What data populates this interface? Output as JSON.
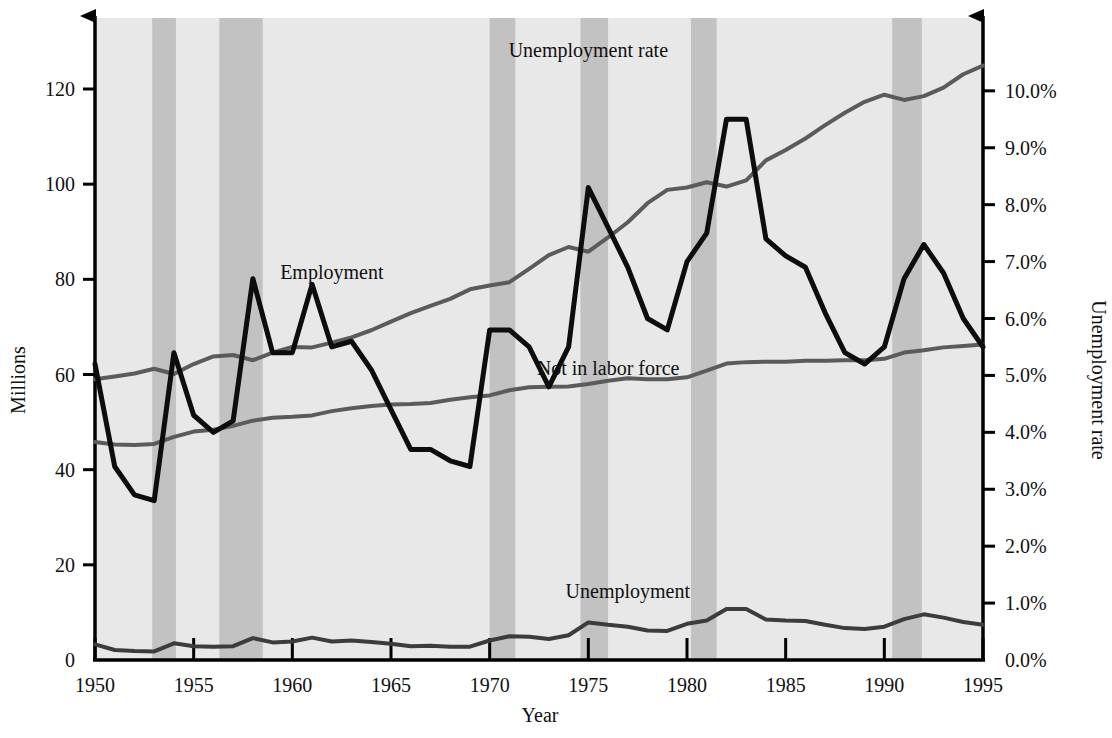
{
  "chart_data": {
    "type": "line",
    "title": "",
    "xlabel": "Year",
    "ylabel_left": "Millions",
    "ylabel_right": "Unemployment rate",
    "xlim": [
      1950,
      1995
    ],
    "ylim_left": [
      0,
      135
    ],
    "ylim_right": [
      0.0,
      11.35
    ],
    "grid": false,
    "legend_position": "inline-annotations",
    "plot_background": "#e8e8e8",
    "recession_band_color": "#c2c2c2",
    "xticks": [
      1950,
      1955,
      1960,
      1965,
      1970,
      1975,
      1980,
      1985,
      1990,
      1995
    ],
    "xtick_labels": [
      "1950",
      "1955",
      "1960",
      "1965",
      "1970",
      "1975",
      "1980",
      "1985",
      "1990",
      "1995"
    ],
    "yticks_left": [
      0,
      20,
      40,
      60,
      80,
      100,
      120
    ],
    "ytick_labels_left": [
      "0",
      "20",
      "40",
      "60",
      "80",
      "100",
      "120"
    ],
    "yticks_right": [
      0.0,
      1.0,
      2.0,
      3.0,
      4.0,
      5.0,
      6.0,
      7.0,
      8.0,
      9.0,
      10.0
    ],
    "ytick_labels_right": [
      "0.0%",
      "1.0%",
      "2.0%",
      "3.0%",
      "4.0%",
      "5.0%",
      "6.0%",
      "7.0%",
      "8.0%",
      "9.0%",
      "10.0%"
    ],
    "x": [
      1950,
      1951,
      1952,
      1953,
      1954,
      1955,
      1956,
      1957,
      1958,
      1959,
      1960,
      1961,
      1962,
      1963,
      1964,
      1965,
      1966,
      1967,
      1968,
      1969,
      1970,
      1971,
      1972,
      1973,
      1974,
      1975,
      1976,
      1977,
      1978,
      1979,
      1980,
      1981,
      1982,
      1983,
      1984,
      1985,
      1986,
      1987,
      1988,
      1989,
      1990,
      1991,
      1992,
      1993,
      1994,
      1995
    ],
    "series": [
      {
        "name": "Employment",
        "axis": "left",
        "unit": "millions",
        "color": "#5b5b5b",
        "line_width": 4,
        "label_x": 1962,
        "label_y": 80,
        "values": [
          59.0,
          59.6,
          60.2,
          61.2,
          60.1,
          62.2,
          63.8,
          64.1,
          63.0,
          64.6,
          65.8,
          65.7,
          66.7,
          67.8,
          69.3,
          71.1,
          72.9,
          74.4,
          75.9,
          77.9,
          78.7,
          79.4,
          82.2,
          85.1,
          86.8,
          85.8,
          88.8,
          92.0,
          96.0,
          98.8,
          99.3,
          100.4,
          99.5,
          100.8,
          105.0,
          107.2,
          109.6,
          112.4,
          115.0,
          117.3,
          118.8,
          117.7,
          118.5,
          120.3,
          123.1,
          124.9
        ]
      },
      {
        "name": "Not in labor force",
        "axis": "left",
        "unit": "millions",
        "color": "#5b5b5b",
        "line_width": 4,
        "label_x": 1976,
        "label_y": 60,
        "values": [
          45.8,
          45.3,
          45.2,
          45.4,
          46.9,
          48.0,
          48.4,
          49.2,
          50.3,
          50.9,
          51.1,
          51.4,
          52.3,
          52.9,
          53.4,
          53.7,
          53.8,
          54.0,
          54.7,
          55.2,
          55.6,
          56.7,
          57.3,
          57.4,
          57.5,
          58.0,
          58.7,
          59.2,
          59.0,
          59.0,
          59.4,
          60.8,
          62.3,
          62.6,
          62.7,
          62.7,
          62.9,
          62.9,
          63.0,
          63.0,
          63.3,
          64.6,
          65.1,
          65.7,
          66.0,
          66.3
        ]
      },
      {
        "name": "Unemployment",
        "axis": "left",
        "unit": "millions",
        "color": "#3c3c3c",
        "line_width": 4,
        "label_x": 1977,
        "label_y": 13,
        "values": [
          3.3,
          2.1,
          1.9,
          1.8,
          3.5,
          2.9,
          2.8,
          2.9,
          4.6,
          3.7,
          3.9,
          4.7,
          3.9,
          4.1,
          3.8,
          3.4,
          2.9,
          3.0,
          2.8,
          2.8,
          4.1,
          5.0,
          4.9,
          4.4,
          5.2,
          7.9,
          7.4,
          7.0,
          6.2,
          6.1,
          7.6,
          8.3,
          10.7,
          10.7,
          8.5,
          8.3,
          8.2,
          7.4,
          6.7,
          6.5,
          7.0,
          8.6,
          9.6,
          8.9,
          8.0,
          7.4
        ]
      },
      {
        "name": "Unemployment rate",
        "axis": "right",
        "unit": "percent",
        "color": "#0d0d0d",
        "line_width": 5,
        "label_x": 1975,
        "label_y": 10.6,
        "values": [
          5.2,
          3.4,
          2.9,
          2.8,
          5.4,
          4.3,
          4.0,
          4.2,
          6.7,
          5.4,
          5.4,
          6.6,
          5.5,
          5.6,
          5.1,
          4.4,
          3.7,
          3.7,
          3.5,
          3.4,
          5.8,
          5.8,
          5.5,
          4.8,
          5.5,
          8.3,
          7.6,
          6.9,
          6.0,
          5.8,
          7.0,
          7.5,
          9.5,
          9.5,
          7.4,
          7.1,
          6.9,
          6.1,
          5.4,
          5.2,
          5.5,
          6.7,
          7.3,
          6.8,
          6.0,
          5.5
        ]
      }
    ],
    "recession_bands": [
      {
        "start": 1952.9,
        "end": 1954.1
      },
      {
        "start": 1956.3,
        "end": 1958.5
      },
      {
        "start": 1970.0,
        "end": 1971.3
      },
      {
        "start": 1974.6,
        "end": 1976.0
      },
      {
        "start": 1980.2,
        "end": 1981.5
      },
      {
        "start": 1990.4,
        "end": 1991.9
      }
    ]
  }
}
